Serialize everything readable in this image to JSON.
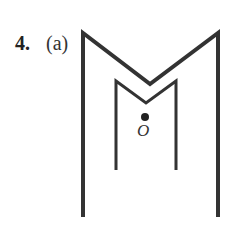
{
  "problem": {
    "number": "4.",
    "part": "(a)"
  },
  "figure": {
    "point_label": "O",
    "stroke_color": "#333333",
    "outer_shape": [
      [
        83,
        33
      ],
      [
        83,
        217
      ],
      [
        218,
        217
      ],
      [
        218,
        33
      ],
      [
        150,
        84
      ]
    ],
    "inner_shape": [
      [
        116,
        81
      ],
      [
        116,
        170
      ],
      [
        176,
        170
      ],
      [
        176,
        81
      ],
      [
        146,
        103
      ]
    ],
    "point": [
      145,
      117
    ]
  }
}
